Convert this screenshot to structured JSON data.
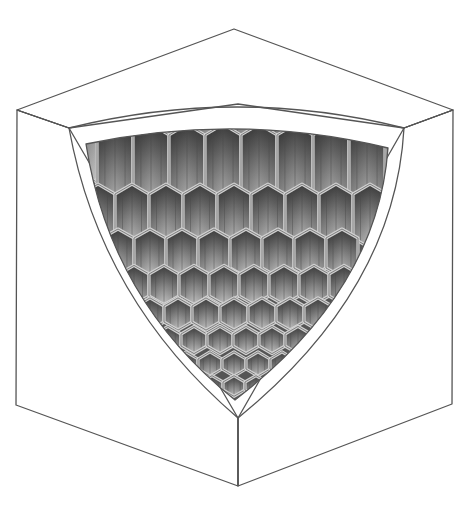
{
  "figure": {
    "colors": {
      "background": "#ffffff",
      "face_left": "#d7d7d7",
      "face_right": "#d4d4d4",
      "face_top": "#dadada",
      "rim": "#cfcfcf",
      "cell_light": "#bdbdbd",
      "cell_dark": "#3c3c3c",
      "outline": "#555555"
    },
    "cube": {
      "top_vertex": [
        234,
        29
      ],
      "left_top": [
        17,
        110
      ],
      "right_top": [
        453,
        110
      ],
      "left_bottom": [
        16,
        405
      ],
      "right_bottom": [
        452,
        404
      ],
      "bottom_vertex": [
        238,
        486
      ],
      "inner_left_top": [
        69,
        128
      ],
      "inner_right_top": [
        404,
        128
      ],
      "inner_bottom": [
        238,
        418
      ]
    },
    "cavity": {
      "rim_width": 17,
      "tip": [
        235,
        400
      ]
    },
    "cell_rows": 8
  }
}
